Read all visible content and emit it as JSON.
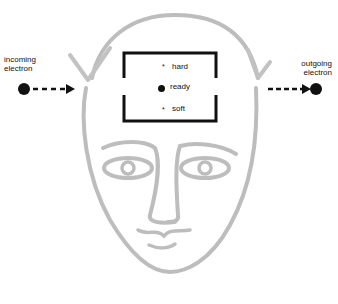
{
  "diagram": {
    "incoming": {
      "line1": "incoming",
      "line2": "electron"
    },
    "outgoing": {
      "line1": "outgoing",
      "line2": "electron"
    },
    "states": [
      {
        "label": "hard",
        "marker": "*"
      },
      {
        "label": "ready",
        "marker": "●"
      },
      {
        "label": "soft",
        "marker": "*"
      }
    ],
    "colors": {
      "ink": "#111111",
      "sketch": "#b8b8b8"
    }
  }
}
